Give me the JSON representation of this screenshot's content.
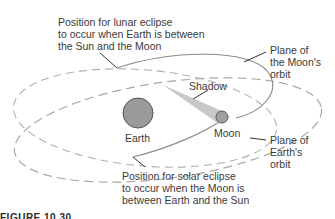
{
  "figure": {
    "caption": "FIGURE 10.30"
  },
  "labels": {
    "lunar_eclipse": [
      "Position for lunar eclipse",
      "to occur when Earth is between",
      "the Sun and the Moon"
    ],
    "moon_orbit_plane": [
      "Plane of",
      "the Moon's",
      "orbit"
    ],
    "shadow": "Shadow",
    "earth": "Earth",
    "moon": "Moon",
    "earth_orbit_plane": [
      "Plane of",
      "Earth's",
      "orbit"
    ],
    "solar_eclipse": [
      "Position for solar eclipse",
      "to occur when the Moon is",
      "between Earth and the Sun"
    ]
  },
  "colors": {
    "earth_fill": "#9a9a9a",
    "moon_fill": "#a0a0a0",
    "body_stroke": "#555555",
    "moon_orbit_stroke": "#8c8c8c",
    "earth_orbit_stroke": "#a8a8a8",
    "shadow_fill": "#c8c8c8",
    "leader_line": "#333333",
    "text": "#3a3a3a"
  }
}
